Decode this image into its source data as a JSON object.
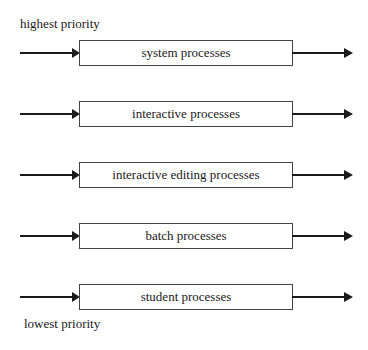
{
  "labels": {
    "top": "highest priority",
    "bottom": "lowest priority"
  },
  "queues": [
    {
      "label": "system processes"
    },
    {
      "label": "interactive processes"
    },
    {
      "label": "interactive editing processes"
    },
    {
      "label": "batch processes"
    },
    {
      "label": "student processes"
    }
  ]
}
